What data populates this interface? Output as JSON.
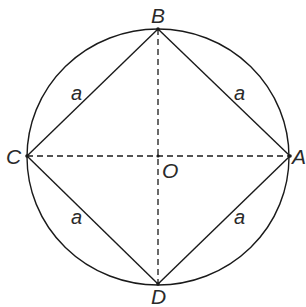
{
  "diagram": {
    "colors": {
      "stroke": "#1a1a1a",
      "text": "#2a2a2a",
      "background": "#ffffff"
    },
    "circle": {
      "cx": 158,
      "cy": 157,
      "rx": 131,
      "ry": 128
    },
    "points": {
      "A": {
        "label": "A",
        "x": 290,
        "y": 156
      },
      "B": {
        "label": "B",
        "x": 158,
        "y": 29
      },
      "C": {
        "label": "C",
        "x": 27,
        "y": 156
      },
      "D": {
        "label": "D",
        "x": 158,
        "y": 284
      },
      "O": {
        "label": "O",
        "x": 158,
        "y": 156
      }
    },
    "sides": [
      {
        "from": "C",
        "to": "B",
        "label": "a"
      },
      {
        "from": "B",
        "to": "A",
        "label": "a"
      },
      {
        "from": "C",
        "to": "D",
        "label": "a"
      },
      {
        "from": "D",
        "to": "A",
        "label": "a"
      }
    ],
    "diagonals": [
      {
        "from": "C",
        "to": "A",
        "style": "dashed"
      },
      {
        "from": "B",
        "to": "D",
        "style": "dashed"
      }
    ]
  }
}
